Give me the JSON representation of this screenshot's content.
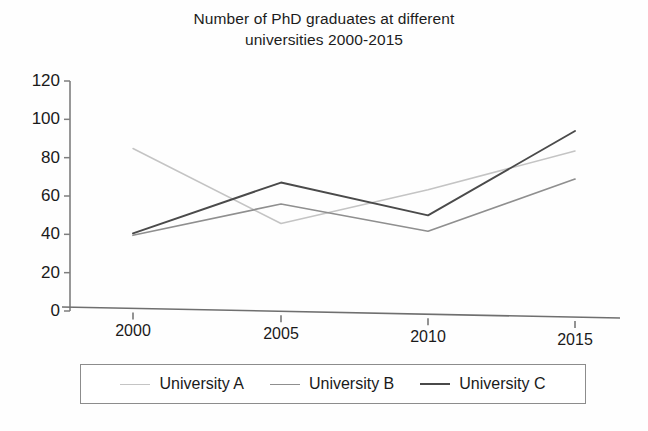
{
  "chart_data": {
    "type": "line",
    "title": "Number of PhD graduates at different universities 2000-2015",
    "title_line1": "Number of PhD graduates at different",
    "title_line2": "universities 2000-2015",
    "xlabel": "",
    "ylabel": "",
    "categories": [
      "2000",
      "2005",
      "2010",
      "2015"
    ],
    "x": [
      2000,
      2005,
      2010,
      2015
    ],
    "ylim": [
      0,
      120
    ],
    "yticks": [
      0,
      20,
      40,
      60,
      80,
      100,
      120
    ],
    "ytick_labels": [
      "0",
      "20",
      "40",
      "60",
      "80",
      "100",
      "120"
    ],
    "grid": false,
    "legend_position": "bottom",
    "series": [
      {
        "name": "University A",
        "values": [
          85,
          47,
          65,
          85
        ],
        "color": "#c4c4c4"
      },
      {
        "name": "University B",
        "values": [
          40,
          57,
          44,
          71
        ],
        "color": "#8f8f8f"
      },
      {
        "name": "University C",
        "values": [
          41,
          68,
          52,
          95
        ],
        "color": "#4a4a4a"
      }
    ]
  },
  "axes": {
    "ytick_labels": [
      "120",
      "100",
      "80",
      "60",
      "40",
      "20",
      "0"
    ],
    "xtick_labels": [
      "2000",
      "2005",
      "2010",
      "2015"
    ]
  },
  "legend": {
    "items": [
      {
        "label": "University A",
        "color": "#c4c4c4",
        "width": "1.6px"
      },
      {
        "label": "University B",
        "color": "#8f8f8f",
        "width": "1.8px"
      },
      {
        "label": "University C",
        "color": "#4a4a4a",
        "width": "2px"
      }
    ]
  }
}
